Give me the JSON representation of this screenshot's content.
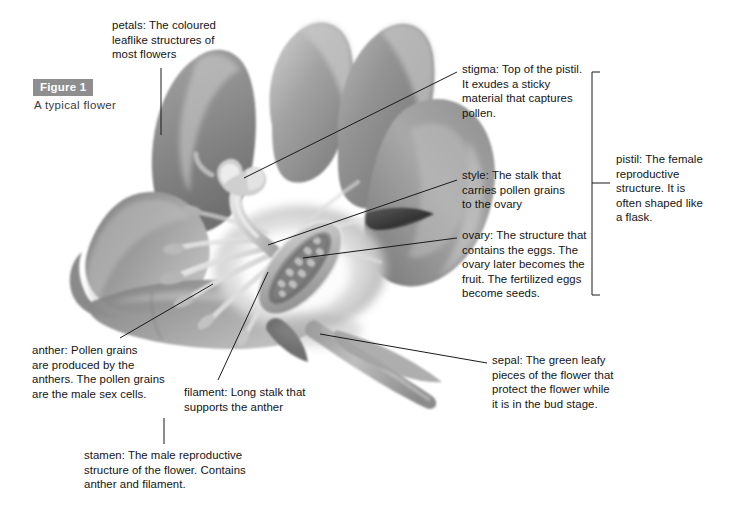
{
  "figure": {
    "badge": "Figure 1",
    "caption": "A typical flower"
  },
  "colors": {
    "badge_bg": "#8e8e8e",
    "badge_text": "#ffffff",
    "text": "#141414",
    "leader_line": "#1a1a1a",
    "background": "#ffffff",
    "petal_mid": "#8c8c8c",
    "petal_light": "#d8d8d8",
    "petal_dark": "#6a6a6a",
    "center_highlight": "#fbfbfb",
    "sepal_dark": "#4a4a4a"
  },
  "callouts": {
    "petals": {
      "term": "petals:",
      "text": "petals: The coloured leaflike structures of most flowers",
      "lines": [
        "petals: The coloured",
        "leaflike structures of",
        "most flowers"
      ]
    },
    "stigma": {
      "term": "stigma:",
      "text": "stigma: Top of the pistil. It exudes a sticky material that captures pollen.",
      "lines": [
        "stigma: Top of the pistil.",
        "It exudes a sticky",
        "material that captures",
        "pollen."
      ]
    },
    "style": {
      "term": "style:",
      "text": "style: The stalk that carries pollen grains to the ovary",
      "lines": [
        "style: The stalk that",
        "carries pollen grains",
        "to the ovary"
      ]
    },
    "ovary": {
      "term": "ovary:",
      "text": "ovary: The structure that contains the eggs. The ovary later becomes the fruit. The fertilized eggs become seeds.",
      "lines": [
        "ovary: The structure that",
        "contains the eggs. The",
        "ovary later becomes the",
        "fruit. The fertilized eggs",
        "become seeds."
      ]
    },
    "pistil": {
      "term": "pistil:",
      "text": "pistil: The female reproductive structure. It is often shaped like a flask.",
      "lines": [
        "pistil: The female",
        "reproductive",
        "structure. It is",
        "often shaped like",
        "a flask."
      ]
    },
    "anther": {
      "term": "anther:",
      "text": "anther: Pollen grains are produced by the anthers. The pollen grains are the male sex cells.",
      "lines": [
        "anther: Pollen grains",
        "are produced by the",
        "anthers. The pollen grains",
        "are the male sex cells."
      ]
    },
    "filament": {
      "term": "filament:",
      "text": "filament: Long stalk that supports the anther",
      "lines": [
        "filament: Long stalk that",
        "supports the anther"
      ]
    },
    "sepal": {
      "term": "sepal:",
      "text": "sepal: The green leafy pieces of the flower that protect the flower while it is in the bud stage.",
      "lines": [
        "sepal: The green leafy",
        "pieces of the flower that",
        "protect the flower while",
        "it is in the bud stage."
      ]
    },
    "stamen": {
      "term": "stamen:",
      "text": "stamen: The male reproductive structure of the flower. Contains anther and filament.",
      "lines": [
        "stamen: The male reproductive",
        "structure of the flower. Contains",
        "anther and filament."
      ]
    }
  },
  "illustration": {
    "subject": "flower-cutaway-grayscale-photo-illustration",
    "parts": [
      "petals",
      "stigma",
      "style",
      "ovary",
      "anther",
      "filament",
      "sepal",
      "stem"
    ]
  }
}
